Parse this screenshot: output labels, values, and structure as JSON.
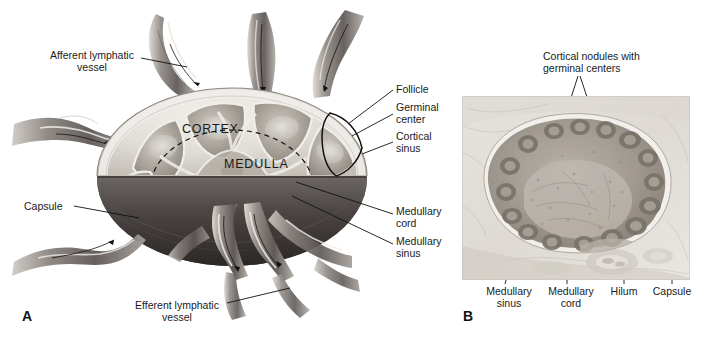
{
  "figure": {
    "type": "anatomical-illustration",
    "background_color": "#ffffff",
    "width": 705,
    "height": 347
  },
  "panel_a": {
    "letter": "A",
    "type": "schematic-drawing",
    "description": "Cut-away diagram of a lymph node showing cortex, medulla, follicles, capsule and afferent/efferent lymphatic vessels",
    "region_labels": [
      {
        "text": "CORTEX",
        "x": 182,
        "y": 122
      },
      {
        "text": "MEDULLA",
        "x": 227,
        "y": 158
      }
    ],
    "labels": [
      {
        "id": "afferent",
        "text": "Afferent lymphatic\nvessel",
        "x": 47,
        "y": 52,
        "align": "left"
      },
      {
        "id": "follicle",
        "text": "Follicle",
        "x": 398,
        "y": 86,
        "align": "left"
      },
      {
        "id": "germinal-center",
        "text": "Germinal\ncenter",
        "x": 398,
        "y": 104,
        "align": "left"
      },
      {
        "id": "cortical-sinus",
        "text": "Cortical\nsinus",
        "x": 398,
        "y": 133,
        "align": "left"
      },
      {
        "id": "capsule",
        "text": "Capsule",
        "x": 28,
        "y": 202,
        "align": "left"
      },
      {
        "id": "medullary-cord",
        "text": "Medullary\ncord",
        "x": 398,
        "y": 208,
        "align": "left"
      },
      {
        "id": "medullary-sinus",
        "text": "Medullary\nsinus",
        "x": 398,
        "y": 238,
        "align": "left"
      },
      {
        "id": "efferent",
        "text": "Efferent lymphatic\nvessel",
        "x": 130,
        "y": 302,
        "align": "left"
      }
    ],
    "colors": {
      "cortex_fill": "#d9d6d0",
      "capsule_dark": "#3f3c3c",
      "vessel_gray": "#777171",
      "outline": "#111111"
    }
  },
  "panel_b": {
    "letter": "B",
    "type": "photomicrograph",
    "description": "Light micrograph of a lymph node section in grayscale",
    "title": "Cortical nodules with\ngerminal centers",
    "labels": [
      {
        "id": "medullary-sinus",
        "text": "Medullary\nsinus",
        "x": 487,
        "y": 289
      },
      {
        "id": "medullary-cord",
        "text": "Medullary\ncord",
        "x": 551,
        "y": 289
      },
      {
        "id": "hilum",
        "text": "Hilum",
        "x": 613,
        "y": 289
      },
      {
        "id": "capsule",
        "text": "Capsule",
        "x": 655,
        "y": 289
      }
    ],
    "frame": {
      "x": 462,
      "y": 96,
      "width": 228,
      "height": 184
    },
    "colors": {
      "tissue_light": "#ddd9d2",
      "tissue_mid": "#a8a29a",
      "nodule_dark": "#6f6962",
      "border": "#b5b0a8"
    }
  }
}
